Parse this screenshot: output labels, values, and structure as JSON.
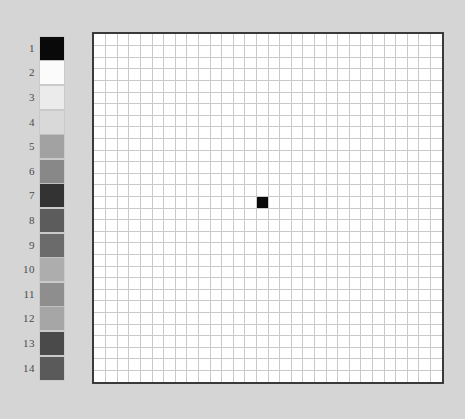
{
  "canvas": {
    "background_color": "#d5d5d5",
    "width": 465,
    "height": 419
  },
  "palette": {
    "name": "grayscale-swatch-palette",
    "swatch_count": 14,
    "swatches": [
      {
        "index": "1",
        "color": "#090909"
      },
      {
        "index": "2",
        "color": "#fbfbfb"
      },
      {
        "index": "3",
        "color": "#ebebeb"
      },
      {
        "index": "4",
        "color": "#d9d9d9"
      },
      {
        "index": "5",
        "color": "#a2a2a2"
      },
      {
        "index": "6",
        "color": "#888888"
      },
      {
        "index": "7",
        "color": "#333333"
      },
      {
        "index": "8",
        "color": "#5c5c5c"
      },
      {
        "index": "9",
        "color": "#6b6b6b"
      },
      {
        "index": "10",
        "color": "#adadad"
      },
      {
        "index": "11",
        "color": "#8e8e8e"
      },
      {
        "index": "12",
        "color": "#a6a6a6"
      },
      {
        "index": "13",
        "color": "#4a4a4a"
      },
      {
        "index": "14",
        "color": "#5a5a5a"
      }
    ]
  },
  "board": {
    "name": "pixel-grid-canvas",
    "columns": 30,
    "rows": 30,
    "cell_size": 11.6,
    "background_color": "#ffffff",
    "grid_line_color": "#c9c9c9",
    "border_color": "#3a3a3a",
    "border_width": 2,
    "filled_cells": [
      {
        "col": 15,
        "row": 15,
        "color": "#0a0a0a"
      }
    ]
  }
}
